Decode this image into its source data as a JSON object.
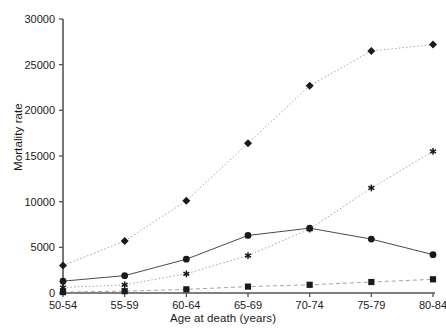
{
  "chart_data": {
    "type": "line",
    "title": "",
    "xlabel": "Age at death (years)",
    "ylabel": "Mortality rate",
    "categories": [
      "50-54",
      "55-59",
      "60-64",
      "65-69",
      "70-74",
      "75-79",
      "80-84"
    ],
    "ylim": [
      0,
      30000
    ],
    "yticks": [
      0,
      5000,
      10000,
      15000,
      20000,
      25000,
      30000
    ],
    "yticklabels": [
      "0",
      "5000",
      "10000",
      "15000",
      "20000",
      "25000",
      "30000"
    ],
    "grid": false,
    "legend": "none",
    "series": [
      {
        "name": "series-diamond",
        "marker": "diamond",
        "linestyle": "dotted",
        "color": "#1a1a1a",
        "values": [
          3000,
          5700,
          10100,
          16400,
          22700,
          26500,
          27200
        ]
      },
      {
        "name": "series-circle",
        "marker": "circle",
        "linestyle": "solid",
        "color": "#1a1a1a",
        "values": [
          1300,
          1900,
          3700,
          6300,
          7100,
          5900,
          4200
        ]
      },
      {
        "name": "series-asterisk",
        "marker": "asterisk",
        "linestyle": "dotted",
        "color": "#1a1a1a",
        "values": [
          600,
          900,
          2100,
          4100,
          7000,
          11500,
          15500
        ]
      },
      {
        "name": "series-square",
        "marker": "square",
        "linestyle": "dashed",
        "color": "#1a1a1a",
        "values": [
          100,
          200,
          400,
          700,
          900,
          1200,
          1500
        ]
      }
    ]
  },
  "axes": {
    "x_title": "Age at death (years)",
    "y_title": "Mortality rate"
  }
}
